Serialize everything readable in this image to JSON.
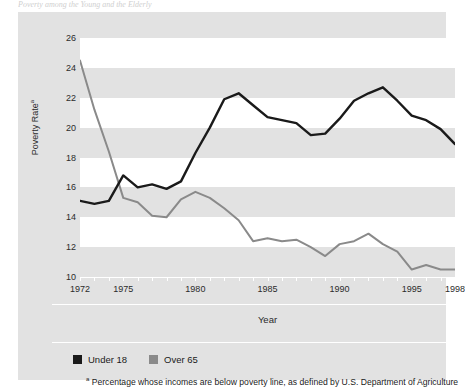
{
  "top_caption": "Poverty among the Young and the Elderly",
  "chart_data": {
    "type": "line",
    "title": "",
    "xlabel": "Year",
    "ylabel": "Poverty Rate",
    "ylabel_superscript": "a",
    "xlim": [
      1972,
      1998
    ],
    "ylim": [
      10,
      26
    ],
    "yticks": [
      10,
      12,
      14,
      16,
      18,
      20,
      22,
      24,
      26
    ],
    "xticks_labeled": [
      1972,
      1975,
      1980,
      1985,
      1990,
      1995,
      1998
    ],
    "grid": "horizontal-bands",
    "legend_position": "below-axis-left",
    "x": [
      1972,
      1973,
      1974,
      1975,
      1976,
      1977,
      1978,
      1979,
      1980,
      1981,
      1982,
      1983,
      1984,
      1985,
      1986,
      1987,
      1988,
      1989,
      1990,
      1991,
      1992,
      1993,
      1994,
      1995,
      1996,
      1997,
      1998
    ],
    "series": [
      {
        "name": "Under 18",
        "color": "#1a1a1a",
        "values": [
          15.1,
          14.9,
          15.1,
          16.8,
          16.0,
          16.2,
          15.9,
          16.4,
          18.3,
          20.0,
          21.9,
          22.3,
          21.5,
          20.7,
          20.5,
          20.3,
          19.5,
          19.6,
          20.6,
          21.8,
          22.3,
          22.7,
          21.8,
          20.8,
          20.5,
          19.9,
          18.9
        ]
      },
      {
        "name": "Over 65",
        "color": "#8a8a8a",
        "values": [
          24.5,
          21.2,
          18.4,
          15.3,
          15.0,
          14.1,
          14.0,
          15.2,
          15.7,
          15.3,
          14.6,
          13.8,
          12.4,
          12.6,
          12.4,
          12.5,
          12.0,
          11.4,
          12.2,
          12.4,
          12.9,
          12.2,
          11.7,
          10.5,
          10.8,
          10.5,
          10.5
        ]
      }
    ]
  },
  "legend": [
    {
      "label": "Under 18",
      "color": "#1a1a1a",
      "swatch": "legend-swatch-dark"
    },
    {
      "label": "Over 65",
      "color": "#8a8a8a",
      "swatch": "legend-swatch-gray"
    }
  ],
  "footnote": {
    "marker": "a",
    "text": " Percentage whose incomes are below poverty line, as defined by U.S. Department of Agriculture"
  }
}
